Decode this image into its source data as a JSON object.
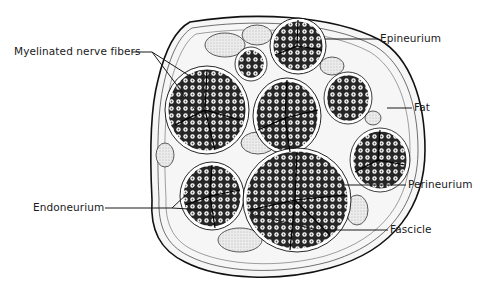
{
  "figure": {
    "labels": {
      "epineurium": "Epineurium",
      "myelinated_nerve_fibers": "Myelinated nerve fibers",
      "fat": "Fat",
      "perineurium": "Perineurium",
      "endoneurium": "Endoneurium",
      "fascicle": "Fascicle"
    }
  },
  "colors": {
    "ink": "#1a1a1a",
    "background": "#ffffff",
    "fascicle_fill": "#2a2a2a",
    "fat_fill": "#e8e8e8"
  }
}
